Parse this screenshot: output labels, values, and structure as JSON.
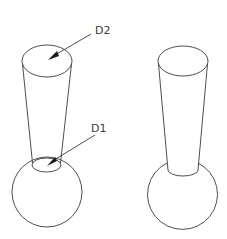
{
  "diagram": {
    "left_figure": {
      "labels": [
        {
          "id": "D2",
          "text": "D2"
        },
        {
          "id": "D1",
          "text": "D1"
        }
      ]
    },
    "right_figure": {
      "labels": []
    },
    "colors": {
      "line": "#3a3a3a",
      "background": "#ffffff"
    }
  }
}
